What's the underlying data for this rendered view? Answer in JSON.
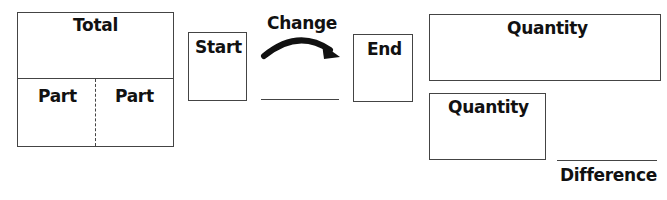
{
  "part_whole": {
    "total_label": "Total",
    "part_left_label": "Part",
    "part_right_label": "Part"
  },
  "change_model": {
    "start_label": "Start",
    "change_label": "Change",
    "end_label": "End",
    "arrow_icon": "curved-arrow-right"
  },
  "comparison_model": {
    "larger_quantity_label": "Quantity",
    "smaller_quantity_label": "Quantity",
    "difference_label": "Difference"
  },
  "colors": {
    "stroke": "#444444",
    "text": "#111111",
    "background": "#ffffff"
  }
}
